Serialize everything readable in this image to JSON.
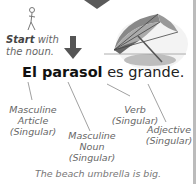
{
  "start_note": {
    "bold": "Start",
    "rest1": " with",
    "rest2": "the noun."
  },
  "sentence": {
    "article_noun": "El parasol",
    "rest": " es grande."
  },
  "labels": {
    "article": [
      "Masculine",
      "Article",
      "(Singular)"
    ],
    "noun": [
      "Masculine",
      "Noun",
      "(Singular)"
    ],
    "verb": [
      "Verb",
      "(Singular)"
    ],
    "adjective": [
      "Adjective",
      "(Singular)"
    ]
  },
  "caption": "The beach umbrella is big.",
  "icons": [
    "stick-figure-icon",
    "down-arrow-icon",
    "beach-umbrella-illustration",
    "top-arrow-icon"
  ],
  "colors": {
    "arrow": "#555555",
    "text": "#222222",
    "label": "#666666"
  }
}
